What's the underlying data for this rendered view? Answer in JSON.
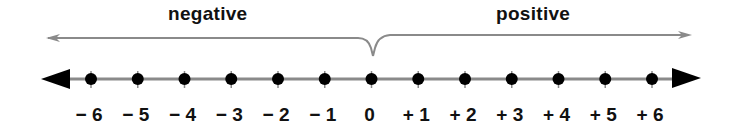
{
  "diagram": {
    "labels": {
      "negative": "negative",
      "positive": "positive"
    },
    "ticks": [
      {
        "value": -6,
        "label": "− 6"
      },
      {
        "value": -5,
        "label": "− 5"
      },
      {
        "value": -4,
        "label": "− 4"
      },
      {
        "value": -3,
        "label": "− 3"
      },
      {
        "value": -2,
        "label": "− 2"
      },
      {
        "value": -1,
        "label": "− 1"
      },
      {
        "value": 0,
        "label": "0"
      },
      {
        "value": 1,
        "label": "+ 1"
      },
      {
        "value": 2,
        "label": "+ 2"
      },
      {
        "value": 3,
        "label": "+ 3"
      },
      {
        "value": 4,
        "label": "+ 4"
      },
      {
        "value": 5,
        "label": "+ 5"
      },
      {
        "value": 6,
        "label": "+ 6"
      }
    ],
    "range": [
      -6,
      6
    ],
    "colors": {
      "line": "#8a8a8a",
      "dots": "#000000",
      "text": "#111111",
      "region_arrows": "#8a8a8a"
    }
  }
}
